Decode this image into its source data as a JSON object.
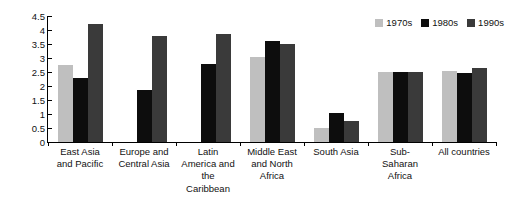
{
  "chart_data": {
    "type": "bar",
    "title": "",
    "subtitle": "",
    "xlabel": "",
    "ylabel": "",
    "ylim": [
      0,
      4.5
    ],
    "ytick_step": 0.5,
    "grid": false,
    "legend_position": "top-right",
    "categories": [
      "East Asia and Pacific",
      "Europe and Central Asia",
      "Latin America and the Caribbean",
      "Middle East and North Africa",
      "South Asia",
      "Sub-Saharan Africa",
      "All countries"
    ],
    "category_lines": [
      [
        "East Asia",
        "and Pacific"
      ],
      [
        "Europe and",
        "Central Asia"
      ],
      [
        "Latin",
        "America and",
        "the",
        "Caribbean"
      ],
      [
        "Middle East",
        "and North",
        "Africa"
      ],
      [
        "South Asia"
      ],
      [
        "Sub-",
        "Saharan",
        "Africa"
      ],
      [
        "All countries"
      ]
    ],
    "ytick_labels": [
      "0",
      "0.5",
      "1",
      "1.5",
      "2",
      "2.5",
      "3",
      "3.5",
      "4",
      "4.5"
    ],
    "ytick_values": [
      0,
      0.5,
      1,
      1.5,
      2,
      2.5,
      3,
      3.5,
      4,
      4.5
    ],
    "series": [
      {
        "name": "1970s",
        "color": "#bfbfbf",
        "values": [
          2.75,
          0,
          0,
          3.05,
          0.5,
          2.5,
          2.55
        ]
      },
      {
        "name": "1980s",
        "color": "#0d0d0d",
        "values": [
          2.3,
          1.85,
          2.8,
          3.6,
          1.05,
          2.5,
          2.45
        ]
      },
      {
        "name": "1990s",
        "color": "#3a3a3a",
        "values": [
          4.2,
          3.8,
          3.85,
          3.5,
          0.75,
          2.5,
          2.65
        ]
      }
    ]
  },
  "legend": {
    "entries": [
      {
        "label": "1970s",
        "color": "#bfbfbf"
      },
      {
        "label": "1980s",
        "color": "#0d0d0d"
      },
      {
        "label": "1990s",
        "color": "#3a3a3a"
      }
    ]
  },
  "colors": {
    "axis": "#000000",
    "text": "#111111",
    "background": "#ffffff",
    "series_1970s": "#bfbfbf",
    "series_1980s": "#0d0d0d",
    "series_1990s": "#3a3a3a"
  }
}
